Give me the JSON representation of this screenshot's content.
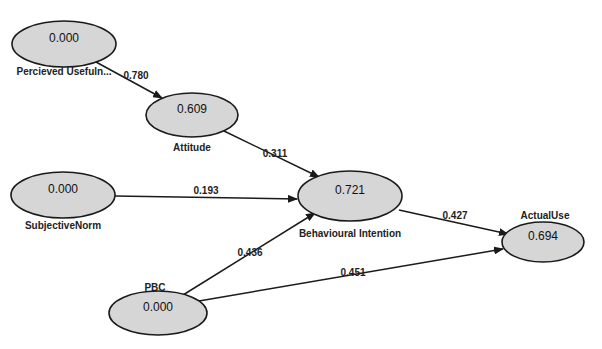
{
  "diagram": {
    "type": "path-model",
    "nodes": [
      {
        "id": "pu",
        "label": "Percieved Usefuln...",
        "value": "0.000",
        "cx": 64,
        "cy": 44,
        "rx": 52,
        "ry": 23,
        "label_x": 64,
        "label_y": 75
      },
      {
        "id": "att",
        "label": "Attitude",
        "value": "0.609",
        "cx": 192,
        "cy": 115,
        "rx": 46,
        "ry": 22,
        "label_x": 192,
        "label_y": 151
      },
      {
        "id": "sn",
        "label": "SubjectiveNorm",
        "value": "0.000",
        "cx": 63,
        "cy": 195,
        "rx": 52,
        "ry": 23,
        "label_x": 63,
        "label_y": 229
      },
      {
        "id": "bi",
        "label": "Behavioural Intention",
        "value": "0.721",
        "cx": 350,
        "cy": 196,
        "rx": 52,
        "ry": 25,
        "label_x": 350,
        "label_y": 237
      },
      {
        "id": "au",
        "label": "ActualUse",
        "value": "0.694",
        "cx": 543,
        "cy": 242,
        "rx": 41,
        "ry": 20,
        "label_x": 545,
        "label_y": 219
      },
      {
        "id": "pbc",
        "label": "PBC",
        "value": "0.000",
        "cx": 158,
        "cy": 313,
        "rx": 49,
        "ry": 22,
        "label_x": 155,
        "label_y": 291
      }
    ],
    "edges": [
      {
        "from": "pu",
        "to": "att",
        "label": "0.780",
        "x1": 96,
        "y1": 62,
        "x2": 162,
        "y2": 98,
        "label_x": 136,
        "label_y": 79
      },
      {
        "from": "att",
        "to": "bi",
        "label": "0.311",
        "x1": 224,
        "y1": 131,
        "x2": 319,
        "y2": 177,
        "label_x": 275,
        "label_y": 157
      },
      {
        "from": "sn",
        "to": "bi",
        "label": "0.193",
        "x1": 115,
        "y1": 196,
        "x2": 297,
        "y2": 199,
        "label_x": 206,
        "label_y": 194
      },
      {
        "from": "bi",
        "to": "au",
        "label": "0.427",
        "x1": 399,
        "y1": 210,
        "x2": 508,
        "y2": 234,
        "label_x": 455,
        "label_y": 219
      },
      {
        "from": "pbc",
        "to": "bi",
        "label": "0.436",
        "x1": 183,
        "y1": 295,
        "x2": 315,
        "y2": 213,
        "label_x": 250,
        "label_y": 256
      },
      {
        "from": "pbc",
        "to": "au",
        "label": "0.451",
        "x1": 199,
        "y1": 301,
        "x2": 503,
        "y2": 249,
        "label_x": 353,
        "label_y": 276
      }
    ]
  },
  "colors": {
    "node_fill": "#d6d6d6",
    "stroke": "#1a1a1a",
    "background": "#ffffff"
  }
}
